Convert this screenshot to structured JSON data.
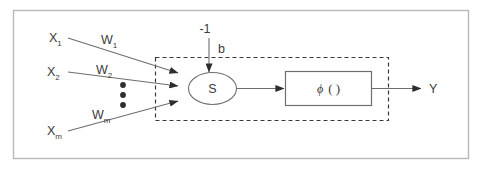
{
  "figure": {
    "frame": {
      "border_color": "#b9b9b9",
      "background": "#ffffff"
    },
    "line_color": "#6e6e6e",
    "text_color": "#3a3a3a"
  },
  "inputs": [
    {
      "base": "X",
      "sub": "1",
      "weight_base": "W",
      "weight_sub": "1"
    },
    {
      "base": "X",
      "sub": "2",
      "weight_base": "W",
      "weight_sub": "2"
    },
    {
      "base": "X",
      "sub": "m",
      "weight_base": "W",
      "weight_sub": "m"
    }
  ],
  "ellipsis": {
    "name": "vertical-dots",
    "count": 3
  },
  "bias": {
    "input_label": "-1",
    "weight_label": "b"
  },
  "summation": {
    "label": "S",
    "shape": "ellipse"
  },
  "activation": {
    "symbol": "ϕ",
    "parens": "(  )",
    "shape": "rectangle"
  },
  "output": {
    "label": "Y"
  },
  "dashed_boundary": {
    "style": "dashed",
    "color": "#3a3a3a"
  }
}
